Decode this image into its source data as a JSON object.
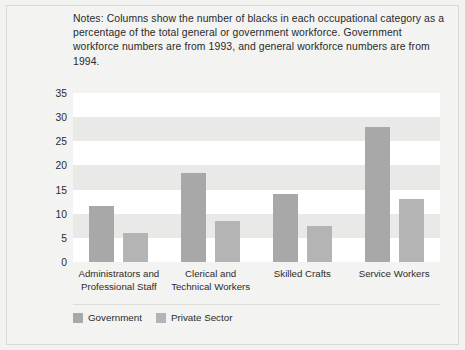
{
  "notes": "Notes: Columns show the number of blacks in each occupational category as a percentage of the total general or government workforce. Government workforce numbers are from 1993, and general workforce numbers are from 1994.",
  "legend": {
    "items": [
      {
        "label": "Government",
        "color": "#a8a8a8"
      },
      {
        "label": "Private Sector",
        "color": "#b4b4b4"
      }
    ]
  },
  "chart_data": {
    "type": "bar",
    "title": "",
    "xlabel": "",
    "ylabel": "Percentage Black",
    "ylim": [
      0,
      35
    ],
    "yticks": [
      0,
      5,
      10,
      15,
      20,
      25,
      30,
      35
    ],
    "ytick_labels": [
      "0",
      "5",
      "10",
      "15",
      "20",
      "25",
      "30",
      "35"
    ],
    "grid": "alternating horizontal bands every 5 units",
    "legend_position": "below plot, left aligned",
    "categories": [
      "Administrators and Professional Staff",
      "Clerical and Technical Workers",
      "Skilled Crafts",
      "Service Workers"
    ],
    "series": [
      {
        "name": "Government",
        "color": "#a8a8a8",
        "values": [
          11.5,
          18.5,
          14.0,
          28.0
        ]
      },
      {
        "name": "Private Sector",
        "color": "#b4b4b4",
        "values": [
          6.0,
          8.5,
          7.5,
          13.0
        ]
      }
    ]
  }
}
